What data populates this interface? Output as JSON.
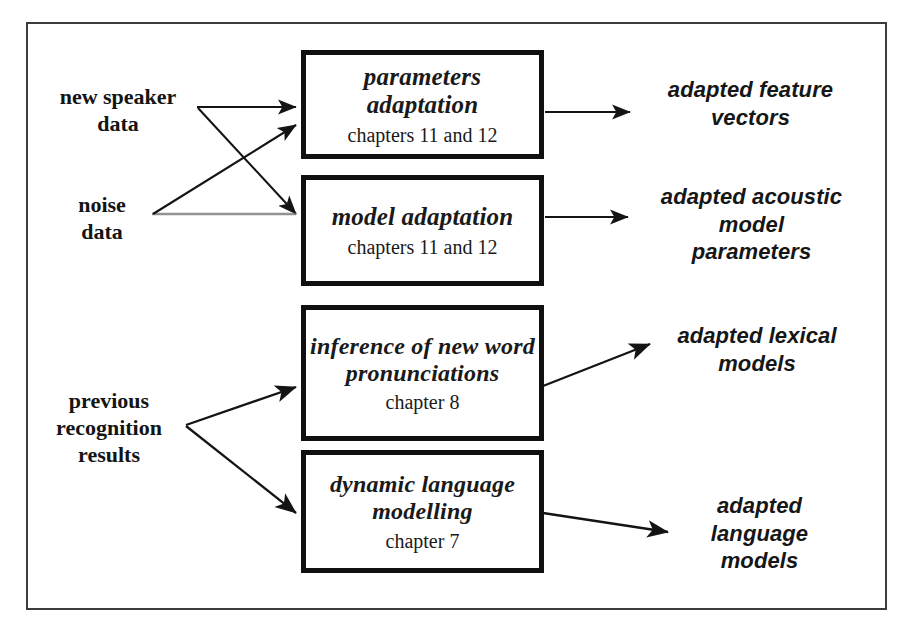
{
  "diagram": {
    "frame_color": "#3c3c3c",
    "box_border_color": "#101010",
    "text_color": "#161616"
  },
  "inputs": [
    {
      "id": "new-speaker-data",
      "label": "new speaker\ndata"
    },
    {
      "id": "noise-data",
      "label": "noise\ndata"
    },
    {
      "id": "previous-results",
      "label": "previous\nrecognition\nresults"
    }
  ],
  "boxes": [
    {
      "id": "parameters-adaptation",
      "title": "parameters\nadaptation",
      "chapter": "chapters 11 and 12"
    },
    {
      "id": "model-adaptation",
      "title": "model\nadaptation",
      "chapter": "chapters 11 and 12"
    },
    {
      "id": "word-pronunciations",
      "title": "inference\nof new word\npronunciations",
      "chapter": "chapter 8"
    },
    {
      "id": "language-modelling",
      "title": "dynamic language\nmodelling",
      "chapter": "chapter 7"
    }
  ],
  "outputs": [
    {
      "id": "adapted-feature-vectors",
      "label": "adapted feature\nvectors"
    },
    {
      "id": "adapted-acoustic-params",
      "label": "adapted acoustic\nmodel\nparameters"
    },
    {
      "id": "adapted-lexical-models",
      "label": "adapted lexical\nmodels"
    },
    {
      "id": "adapted-language-models",
      "label": "adapted\nlanguage\nmodels"
    }
  ]
}
